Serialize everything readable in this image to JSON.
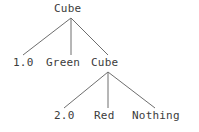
{
  "figure": {
    "type": "parse-tree",
    "background_color": "#ffffff",
    "text_color": "#3c3c3c",
    "edge_color": "#6e6e6e"
  },
  "tree": {
    "root": {
      "label": "Cube",
      "children": [
        {
          "label": "1.0"
        },
        {
          "label": "Green"
        },
        {
          "label": "Cube",
          "children": [
            {
              "label": "2.0"
            },
            {
              "label": "Red"
            },
            {
              "label": "Nothing"
            }
          ]
        }
      ]
    }
  },
  "labels": {
    "root_cube": "Cube",
    "weight_one": "1.0",
    "green": "Green",
    "cube_two": "Cube",
    "weight_two": "2.0",
    "red": "Red",
    "nothing": "Nothing"
  }
}
